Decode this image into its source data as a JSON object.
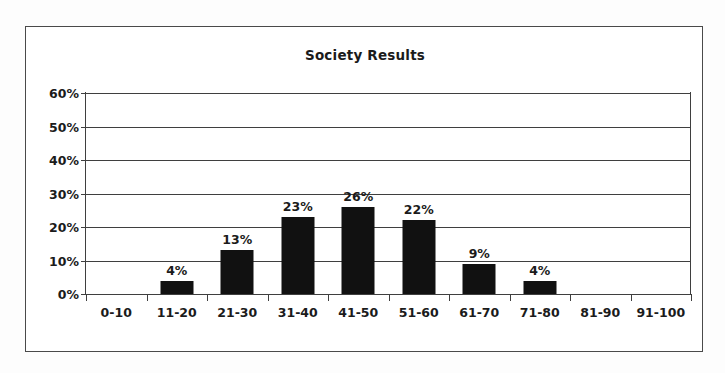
{
  "chart_data": {
    "type": "bar",
    "title": "Society Results",
    "xlabel": "",
    "ylabel": "",
    "categories": [
      "0-10",
      "11-20",
      "21-30",
      "31-40",
      "41-50",
      "51-60",
      "61-70",
      "71-80",
      "81-90",
      "91-100"
    ],
    "values": [
      0,
      4,
      13,
      23,
      26,
      22,
      9,
      4,
      0,
      0
    ],
    "value_labels": [
      "",
      "4%",
      "13%",
      "23%",
      "26%",
      "22%",
      "9%",
      "4%",
      "",
      ""
    ],
    "ytick_labels": [
      "0%",
      "10%",
      "20%",
      "30%",
      "40%",
      "50%",
      "60%"
    ],
    "ytick_values": [
      0,
      10,
      20,
      30,
      40,
      50,
      60
    ],
    "ylim": [
      0,
      60
    ],
    "grid": true,
    "legend": false,
    "bar_color": "#111111",
    "axis_color": "#3f3f3f",
    "text_color": "#1b1b1b",
    "frame_color": "#4a4a4a",
    "background": "#ffffff"
  }
}
